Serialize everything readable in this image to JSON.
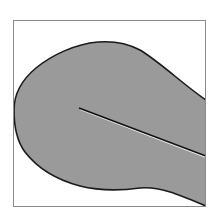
{
  "figure": {
    "colors": {
      "background": "#ffffff",
      "frame": "#8a8a8a",
      "body_fill": "#9a9a9a",
      "outline": "#1a1a1a",
      "crack": "#111111",
      "crack_highlight": "#e8e8e8"
    },
    "frame": {
      "x": 13,
      "y": 20,
      "width": 193,
      "height": 187
    },
    "crack": {
      "x1": 79,
      "y1": 108,
      "x2": 206,
      "y2": 156
    }
  }
}
